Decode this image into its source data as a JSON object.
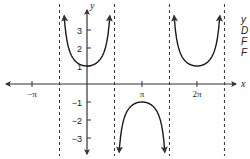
{
  "chart_data": {
    "type": "line",
    "title": "",
    "function": "y = sec x",
    "xlabel": "x",
    "ylabel": "y",
    "x_ticks": [
      {
        "value": -3.14159,
        "label": "−π"
      },
      {
        "value": 3.14159,
        "label": "π"
      },
      {
        "value": 6.28319,
        "label": "2π"
      }
    ],
    "y_ticks": [
      {
        "value": 3,
        "label": "3"
      },
      {
        "value": 2,
        "label": "2"
      },
      {
        "value": 1,
        "label": "1"
      },
      {
        "value": -1,
        "label": "−1"
      },
      {
        "value": -2,
        "label": "−2"
      },
      {
        "value": -3,
        "label": "−3"
      }
    ],
    "asymptotes_x": [
      -1.5708,
      1.5708,
      4.7124,
      7.854
    ],
    "branches": [
      {
        "x_range": [
          -1.5708,
          1.5708
        ],
        "vertex": [
          0,
          1
        ],
        "opens": "up"
      },
      {
        "x_range": [
          1.5708,
          4.7124
        ],
        "vertex": [
          3.14159,
          -1
        ],
        "opens": "down"
      },
      {
        "x_range": [
          4.7124,
          7.854
        ],
        "vertex": [
          6.28319,
          1
        ],
        "opens": "up"
      }
    ],
    "xlim": [
      -4.8,
      8.9
    ],
    "ylim": [
      -4.2,
      4.6
    ],
    "grid": false,
    "legend": null
  },
  "side_text": [
    "y",
    "D",
    "F",
    "F"
  ],
  "colors": {
    "curve": "#1a1a1a",
    "axis": "#333333",
    "asymptote": "#333333",
    "background": "#ffffff"
  }
}
